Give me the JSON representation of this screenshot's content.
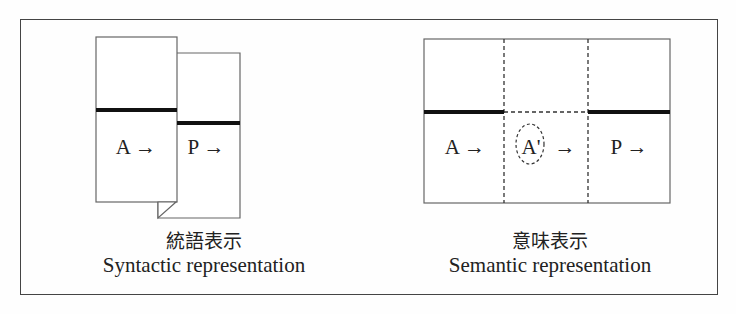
{
  "syntactic": {
    "cells": [
      "A →",
      "P →"
    ],
    "caption_ja": "統語表示",
    "caption_en": "Syntactic representation"
  },
  "semantic": {
    "cells": [
      "A →",
      "A'",
      "→",
      "P →"
    ],
    "caption_ja": "意味表示",
    "caption_en": "Semantic representation"
  }
}
